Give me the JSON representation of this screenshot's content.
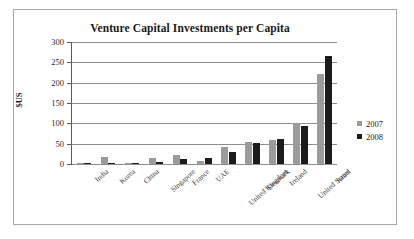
{
  "chart_data": {
    "type": "bar",
    "title": "Venture Capital Investments per Capita",
    "xlabel": "",
    "ylabel": "$US",
    "ylim": [
      0,
      300
    ],
    "yticks": [
      0,
      50,
      100,
      150,
      200,
      250,
      300
    ],
    "ytick_labels": [
      "0",
      "50",
      "100",
      "150",
      "200",
      "250",
      "300"
    ],
    "grid": true,
    "legend_position": "right",
    "categories": [
      "India",
      "Korea",
      "China",
      "Singapore",
      "France",
      "UAE",
      "United Kingdom",
      "Denmark",
      "Ireland",
      "United States",
      "Israel"
    ],
    "series": [
      {
        "name": "2007",
        "color": "#9b9b9b",
        "values": [
          2,
          17,
          1,
          14,
          21,
          8,
          41,
          55,
          59,
          102,
          222
        ]
      },
      {
        "name": "2008",
        "color": "#1c1c1c",
        "values": [
          3,
          2,
          1,
          5,
          13,
          16,
          30,
          51,
          62,
          93,
          265
        ]
      }
    ]
  },
  "colors": {
    "frame": "#a8a8a8",
    "gridline": "#8f8f8f",
    "axis": "#5a5a5a",
    "text": "#1d1d1d",
    "background": "#ffffff"
  }
}
